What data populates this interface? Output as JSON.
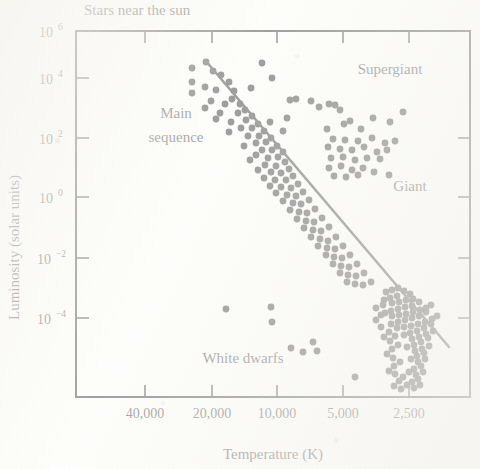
{
  "chart_data": {
    "type": "scatter",
    "title": "Stars near the sun",
    "xlabel": "Temperature (K)",
    "ylabel": "Luminosity (solar units)",
    "xticks": [
      "40,000",
      "20,000",
      "10,000",
      "5,000",
      "2,500"
    ],
    "xtick_values": [
      40000,
      20000,
      10000,
      5000,
      2500
    ],
    "x_axis_direction": "reversed",
    "x_scale": "log",
    "y_scale": "log",
    "yticks": [
      "10",
      "10",
      "10",
      "10",
      "10",
      "10"
    ],
    "ytick_exponents": [
      "6",
      "4",
      "2",
      "0",
      "−2",
      "−4"
    ],
    "ytick_values": [
      1000000,
      10000,
      100,
      1,
      0.01,
      0.0001
    ],
    "ylim": [
      1e-05,
      4000000
    ],
    "xlim": [
      60000,
      2000
    ],
    "grid": false,
    "legend": "none",
    "annotations": [
      {
        "label": "Main\nsequence",
        "name": "main-sequence",
        "line1": "Main",
        "line2": "sequence",
        "x_px": 176,
        "y_px": 118
      },
      {
        "label": "Supergiant",
        "name": "supergiant",
        "x_px": 390,
        "y_px": 74
      },
      {
        "label": "Giant",
        "name": "giant",
        "x_px": 410,
        "y_px": 191
      },
      {
        "label": "White dwarfs",
        "name": "white-dwarfs",
        "x_px": 243,
        "y_px": 363
      }
    ],
    "trend_line": {
      "name": "main-sequence-fit-line",
      "description": "straight line through the main sequence",
      "x1_px": 205,
      "y1_px": 60,
      "x2_px": 449,
      "y2_px": 347
    },
    "series": [
      {
        "name": "Main sequence",
        "color": "#0d0d0d",
        "marker": "circle",
        "points_px": [
          [
            206,
            62
          ],
          [
            192,
            68
          ],
          [
            213,
            71
          ],
          [
            221,
            75
          ],
          [
            229,
            82
          ],
          [
            192,
            82
          ],
          [
            205,
            87
          ],
          [
            192,
            93
          ],
          [
            216,
            90
          ],
          [
            234,
            91
          ],
          [
            232,
            99
          ],
          [
            225,
            104
          ],
          [
            240,
            104
          ],
          [
            211,
            101
          ],
          [
            205,
            108
          ],
          [
            220,
            113
          ],
          [
            238,
            113
          ],
          [
            245,
            110
          ],
          [
            216,
            119
          ],
          [
            231,
            122
          ],
          [
            246,
            120
          ],
          [
            252,
            116
          ],
          [
            241,
            128
          ],
          [
            252,
            128
          ],
          [
            258,
            124
          ],
          [
            229,
            132
          ],
          [
            248,
            136
          ],
          [
            259,
            136
          ],
          [
            264,
            131
          ],
          [
            256,
            143
          ],
          [
            266,
            142
          ],
          [
            271,
            138
          ],
          [
            244,
            146
          ],
          [
            262,
            150
          ],
          [
            272,
            150
          ],
          [
            277,
            146
          ],
          [
            256,
            155
          ],
          [
            268,
            158
          ],
          [
            278,
            157
          ],
          [
            283,
            152
          ],
          [
            250,
            160
          ],
          [
            265,
            165
          ],
          [
            276,
            166
          ],
          [
            285,
            162
          ],
          [
            258,
            170
          ],
          [
            271,
            172
          ],
          [
            281,
            173
          ],
          [
            289,
            169
          ],
          [
            264,
            178
          ],
          [
            275,
            180
          ],
          [
            286,
            180
          ],
          [
            293,
            176
          ],
          [
            270,
            186
          ],
          [
            281,
            187
          ],
          [
            291,
            188
          ],
          [
            298,
            184
          ],
          [
            276,
            193
          ],
          [
            287,
            195
          ],
          [
            296,
            196
          ],
          [
            303,
            192
          ],
          [
            283,
            201
          ],
          [
            293,
            203
          ],
          [
            301,
            204
          ],
          [
            309,
            200
          ],
          [
            290,
            210
          ],
          [
            299,
            212
          ],
          [
            307,
            213
          ],
          [
            315,
            209
          ],
          [
            297,
            219
          ],
          [
            306,
            221
          ],
          [
            314,
            222
          ],
          [
            322,
            218
          ],
          [
            304,
            228
          ],
          [
            313,
            230
          ],
          [
            321,
            231
          ],
          [
            329,
            227
          ],
          [
            311,
            237
          ],
          [
            320,
            239
          ],
          [
            328,
            241
          ],
          [
            336,
            237
          ],
          [
            318,
            246
          ],
          [
            327,
            248
          ],
          [
            335,
            249
          ],
          [
            343,
            246
          ],
          [
            326,
            255
          ],
          [
            334,
            257
          ],
          [
            342,
            258
          ],
          [
            350,
            255
          ],
          [
            333,
            264
          ],
          [
            341,
            266
          ],
          [
            349,
            267
          ],
          [
            357,
            264
          ],
          [
            340,
            273
          ],
          [
            348,
            275
          ],
          [
            356,
            276
          ],
          [
            364,
            273
          ],
          [
            347,
            282
          ],
          [
            355,
            284
          ],
          [
            363,
            285
          ],
          [
            371,
            282
          ]
        ]
      },
      {
        "name": "Cool dwarf cluster",
        "color": "#0d0d0d",
        "marker": "circle",
        "points_px": [
          [
            386,
            292
          ],
          [
            392,
            290
          ],
          [
            398,
            288
          ],
          [
            404,
            291
          ],
          [
            410,
            294
          ],
          [
            397,
            296
          ],
          [
            390,
            298
          ],
          [
            384,
            300
          ],
          [
            392,
            303
          ],
          [
            399,
            302
          ],
          [
            406,
            300
          ],
          [
            413,
            299
          ],
          [
            419,
            302
          ],
          [
            412,
            306
          ],
          [
            405,
            307
          ],
          [
            398,
            309
          ],
          [
            391,
            311
          ],
          [
            385,
            313
          ],
          [
            392,
            316
          ],
          [
            399,
            315
          ],
          [
            406,
            314
          ],
          [
            413,
            312
          ],
          [
            420,
            310
          ],
          [
            426,
            308
          ],
          [
            431,
            305
          ],
          [
            426,
            312
          ],
          [
            419,
            316
          ],
          [
            412,
            318
          ],
          [
            405,
            320
          ],
          [
            398,
            322
          ],
          [
            391,
            324
          ],
          [
            397,
            328
          ],
          [
            404,
            327
          ],
          [
            411,
            326
          ],
          [
            418,
            324
          ],
          [
            425,
            322
          ],
          [
            432,
            319
          ],
          [
            437,
            316
          ],
          [
            431,
            324
          ],
          [
            424,
            328
          ],
          [
            417,
            331
          ],
          [
            410,
            333
          ],
          [
            404,
            335
          ],
          [
            412,
            339
          ],
          [
            419,
            337
          ],
          [
            426,
            334
          ],
          [
            433,
            331
          ],
          [
            428,
            338
          ],
          [
            421,
            342
          ],
          [
            414,
            345
          ],
          [
            407,
            347
          ],
          [
            415,
            351
          ],
          [
            422,
            349
          ],
          [
            429,
            346
          ],
          [
            424,
            353
          ],
          [
            417,
            356
          ],
          [
            411,
            359
          ],
          [
            418,
            362
          ],
          [
            425,
            359
          ],
          [
            421,
            366
          ],
          [
            414,
            369
          ],
          [
            409,
            372
          ],
          [
            416,
            375
          ],
          [
            423,
            372
          ],
          [
            418,
            379
          ],
          [
            412,
            382
          ],
          [
            407,
            385
          ],
          [
            414,
            388
          ],
          [
            420,
            385
          ],
          [
            401,
            389
          ],
          [
            394,
            386
          ],
          [
            399,
            381
          ],
          [
            403,
            377
          ],
          [
            395,
            374
          ],
          [
            389,
            371
          ],
          [
            394,
            366
          ],
          [
            400,
            362
          ],
          [
            393,
            358
          ],
          [
            387,
            354
          ],
          [
            392,
            349
          ],
          [
            398,
            345
          ],
          [
            390,
            341
          ],
          [
            384,
            337
          ],
          [
            389,
            332
          ],
          [
            395,
            336
          ],
          [
            381,
            327
          ],
          [
            376,
            320
          ],
          [
            381,
            315
          ],
          [
            376,
            308
          ],
          [
            383,
            305
          ]
        ]
      },
      {
        "name": "Supergiant",
        "color": "#0d0d0d",
        "marker": "circle",
        "points_px": [
          [
            262,
            63
          ],
          [
            272,
            78
          ],
          [
            290,
            100
          ],
          [
            296,
            99
          ],
          [
            311,
            101
          ],
          [
            319,
            107
          ],
          [
            329,
            104
          ],
          [
            335,
            105
          ],
          [
            340,
            110
          ],
          [
            251,
            88
          ],
          [
            287,
            118
          ],
          [
            270,
            122
          ],
          [
            344,
            124
          ],
          [
            373,
            118
          ],
          [
            403,
            112
          ],
          [
            327,
            129
          ],
          [
            361,
            129
          ],
          [
            283,
            131
          ]
        ]
      },
      {
        "name": "Giant",
        "color": "#0d0d0d",
        "marker": "circle",
        "points_px": [
          [
            350,
            121
          ],
          [
            390,
            122
          ],
          [
            333,
            139
          ],
          [
            345,
            140
          ],
          [
            358,
            141
          ],
          [
            372,
            138
          ],
          [
            385,
            143
          ],
          [
            395,
            141
          ],
          [
            328,
            147
          ],
          [
            340,
            149
          ],
          [
            352,
            150
          ],
          [
            364,
            147
          ],
          [
            377,
            152
          ],
          [
            387,
            150
          ],
          [
            331,
            158
          ],
          [
            343,
            157
          ],
          [
            355,
            160
          ],
          [
            367,
            158
          ],
          [
            380,
            159
          ],
          [
            329,
            168
          ],
          [
            341,
            166
          ],
          [
            352,
            170
          ],
          [
            363,
            168
          ],
          [
            374,
            172
          ],
          [
            334,
            176
          ],
          [
            346,
            177
          ],
          [
            358,
            175
          ],
          [
            389,
            175
          ]
        ]
      },
      {
        "name": "White dwarfs",
        "color": "#0d0d0d",
        "marker": "circle",
        "points_px": [
          [
            226,
            309
          ],
          [
            271,
            307
          ],
          [
            272,
            322
          ],
          [
            291,
            348
          ],
          [
            303,
            352
          ],
          [
            313,
            342
          ],
          [
            317,
            351
          ],
          [
            355,
            377
          ]
        ]
      }
    ]
  },
  "figure": {
    "plot_box": {
      "left": 76,
      "top": 31,
      "right": 470,
      "bottom": 397
    },
    "ytick_px": [
      31,
      78,
      138,
      197,
      258,
      318
    ],
    "xtick_px": [
      145,
      212,
      277,
      343,
      409
    ]
  }
}
